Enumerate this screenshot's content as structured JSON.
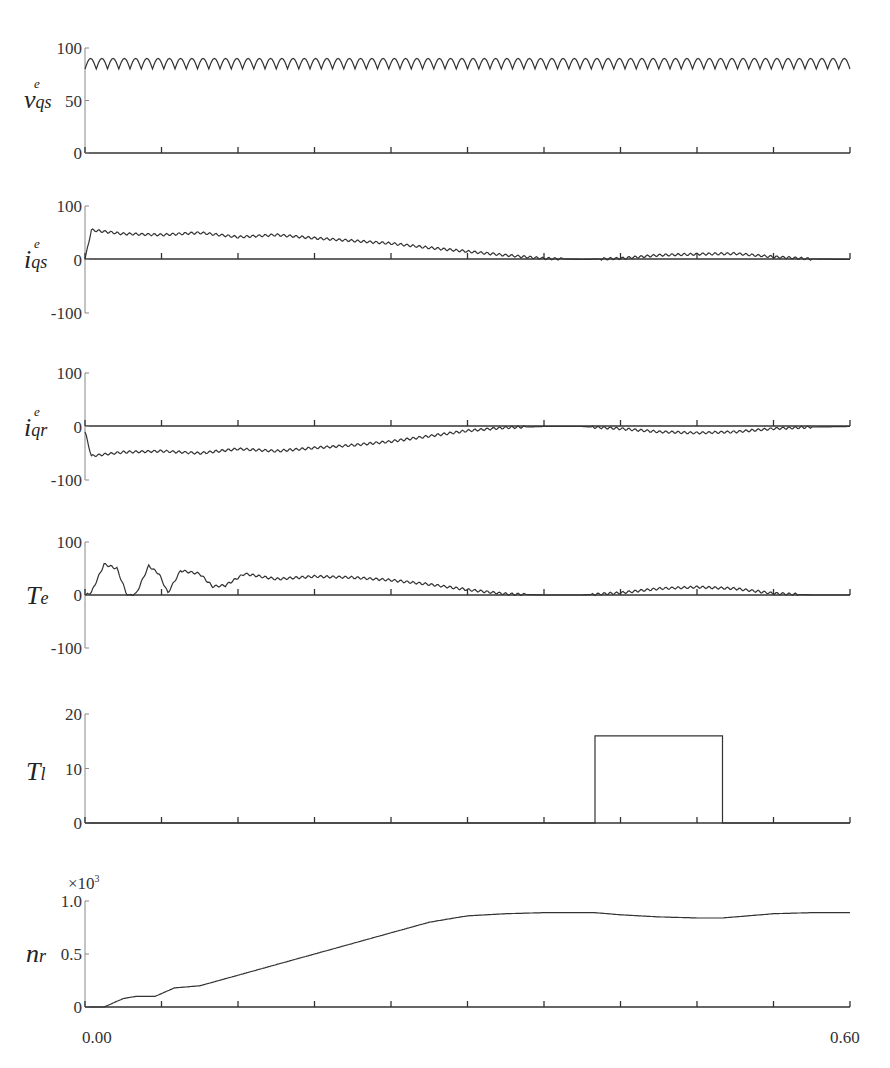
{
  "chart_data": {
    "type": "line",
    "title": "",
    "xlabel": "",
    "xlim": [
      0.0,
      0.6
    ],
    "x_tick_labels": [
      "0.00",
      "0.60"
    ],
    "x_ticks": [
      0.0,
      0.06,
      0.12,
      0.18,
      0.24,
      0.3,
      0.36,
      0.42,
      0.48,
      0.54,
      0.6
    ],
    "grid": false,
    "legend": "none",
    "panels": [
      {
        "id": "vqs",
        "ylabel": "v_qs^e",
        "ylabel_main": "v",
        "ylabel_sub": "qs",
        "ylabel_sup": "e",
        "ylim": [
          0,
          100
        ],
        "y_ticks": [
          "0",
          "50",
          "100"
        ],
        "description": "Constant oscillating voltage ~80-90 with ripple",
        "x": [
          0.0,
          0.6
        ],
        "mean": 85,
        "ripple_amplitude": 5,
        "ripple_cycles": 68
      },
      {
        "id": "iqs",
        "ylabel": "i_qs^e",
        "ylabel_main": "i",
        "ylabel_sub": "qs",
        "ylabel_sup": "e",
        "ylim": [
          -100,
          100
        ],
        "y_ticks": [
          "-100",
          "0",
          "100"
        ],
        "x": [
          0.0,
          0.005,
          0.03,
          0.06,
          0.09,
          0.12,
          0.15,
          0.18,
          0.21,
          0.24,
          0.27,
          0.3,
          0.33,
          0.36,
          0.39,
          0.42,
          0.45,
          0.48,
          0.51,
          0.54,
          0.57,
          0.6
        ],
        "values": [
          0,
          55,
          48,
          46,
          50,
          42,
          46,
          40,
          35,
          30,
          22,
          15,
          8,
          2,
          0,
          2,
          8,
          10,
          11,
          5,
          1,
          0
        ]
      },
      {
        "id": "iqr",
        "ylabel": "i_qr^e",
        "ylabel_main": "i",
        "ylabel_sub": "qr",
        "ylabel_sup": "e",
        "ylim": [
          -100,
          100
        ],
        "y_ticks": [
          "-100",
          "0",
          "100"
        ],
        "x": [
          0.0,
          0.005,
          0.03,
          0.06,
          0.09,
          0.12,
          0.15,
          0.18,
          0.21,
          0.24,
          0.27,
          0.3,
          0.33,
          0.36,
          0.39,
          0.42,
          0.45,
          0.48,
          0.51,
          0.54,
          0.57,
          0.6
        ],
        "values": [
          -10,
          -55,
          -48,
          -46,
          -50,
          -42,
          -46,
          -40,
          -35,
          -28,
          -18,
          -8,
          -2,
          0,
          0,
          -4,
          -10,
          -12,
          -10,
          -4,
          -1,
          0
        ]
      },
      {
        "id": "Te",
        "ylabel": "T_e",
        "ylabel_main": "T",
        "ylabel_sub": "e",
        "ylim": [
          -100,
          100
        ],
        "y_ticks": [
          "-100",
          "0",
          "100"
        ],
        "x": [
          0.0,
          0.005,
          0.015,
          0.025,
          0.033,
          0.04,
          0.05,
          0.058,
          0.065,
          0.075,
          0.09,
          0.1,
          0.11,
          0.125,
          0.15,
          0.18,
          0.21,
          0.24,
          0.27,
          0.3,
          0.33,
          0.36,
          0.39,
          0.42,
          0.45,
          0.48,
          0.51,
          0.54,
          0.57,
          0.6
        ],
        "values": [
          0,
          5,
          58,
          50,
          0,
          2,
          55,
          40,
          4,
          46,
          40,
          16,
          18,
          40,
          30,
          35,
          33,
          28,
          20,
          10,
          2,
          0,
          0,
          4,
          12,
          15,
          12,
          3,
          0,
          0
        ]
      },
      {
        "id": "Tl",
        "ylabel": "T_l",
        "ylabel_main": "T",
        "ylabel_sub": "l",
        "ylim": [
          0,
          20
        ],
        "y_ticks": [
          "0",
          "10",
          "20"
        ],
        "x": [
          0.0,
          0.4,
          0.4,
          0.5,
          0.5,
          0.6
        ],
        "values": [
          0,
          0,
          16,
          16,
          0,
          0
        ]
      },
      {
        "id": "nr",
        "ylabel": "n_r",
        "ylabel_main": "n",
        "ylabel_sub": "r",
        "y_multiplier": "×10",
        "y_multiplier_exp": "3",
        "ylim": [
          0,
          1.0
        ],
        "y_ticks": [
          "0",
          "0.5",
          "1.0"
        ],
        "x": [
          0.0,
          0.015,
          0.03,
          0.04,
          0.055,
          0.07,
          0.09,
          0.12,
          0.15,
          0.18,
          0.21,
          0.24,
          0.27,
          0.3,
          0.33,
          0.36,
          0.4,
          0.42,
          0.45,
          0.48,
          0.5,
          0.52,
          0.54,
          0.57,
          0.6
        ],
        "values": [
          0,
          0,
          0.08,
          0.1,
          0.1,
          0.18,
          0.2,
          0.3,
          0.4,
          0.5,
          0.6,
          0.7,
          0.8,
          0.86,
          0.88,
          0.89,
          0.89,
          0.87,
          0.85,
          0.84,
          0.84,
          0.86,
          0.88,
          0.89,
          0.89
        ]
      }
    ]
  },
  "labels": {
    "x_start": "0.00",
    "x_end": "0.60",
    "nr_multiplier": "×10",
    "nr_multiplier_exp": "3"
  }
}
